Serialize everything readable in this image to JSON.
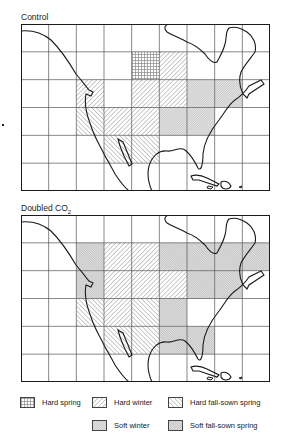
{
  "figure": {
    "maps": [
      {
        "id": "control",
        "title": "Control",
        "title_sub": "",
        "grid": {
          "cols": 9,
          "rows": 6
        },
        "cells": [
          {
            "row": 1,
            "col": 4,
            "type": "hard_spring"
          },
          {
            "row": 1,
            "col": 5,
            "type": "hard_winter"
          },
          {
            "row": 2,
            "col": 2,
            "type": "hard_winter"
          },
          {
            "row": 2,
            "col": 4,
            "type": "hard_winter"
          },
          {
            "row": 2,
            "col": 5,
            "type": "hard_winter"
          },
          {
            "row": 2,
            "col": 6,
            "type": "soft_winter"
          },
          {
            "row": 2,
            "col": 7,
            "type": "soft_winter"
          },
          {
            "row": 3,
            "col": 2,
            "type": "hard_fall_sown_spring"
          },
          {
            "row": 3,
            "col": 3,
            "type": "hard_winter"
          },
          {
            "row": 3,
            "col": 4,
            "type": "hard_winter"
          },
          {
            "row": 3,
            "col": 5,
            "type": "soft_winter"
          },
          {
            "row": 3,
            "col": 6,
            "type": "soft_winter"
          },
          {
            "row": 4,
            "col": 3,
            "type": "hard_fall_sown_spring"
          },
          {
            "row": 4,
            "col": 4,
            "type": "hard_fall_sown_spring"
          }
        ]
      },
      {
        "id": "doubled_co2",
        "title": "Doubled CO",
        "title_sub": "2",
        "grid": {
          "cols": 9,
          "rows": 6
        },
        "cells": [
          {
            "row": 1,
            "col": 2,
            "type": "soft_fall_sown_spring"
          },
          {
            "row": 1,
            "col": 3,
            "type": "hard_winter"
          },
          {
            "row": 1,
            "col": 4,
            "type": "hard_winter"
          },
          {
            "row": 1,
            "col": 5,
            "type": "soft_fall_sown_spring"
          },
          {
            "row": 1,
            "col": 6,
            "type": "soft_fall_sown_spring"
          },
          {
            "row": 1,
            "col": 7,
            "type": "soft_fall_sown_spring"
          },
          {
            "row": 1,
            "col": 8,
            "type": "soft_fall_sown_spring"
          },
          {
            "row": 2,
            "col": 2,
            "type": "soft_fall_sown_spring"
          },
          {
            "row": 2,
            "col": 3,
            "type": "hard_winter"
          },
          {
            "row": 2,
            "col": 4,
            "type": "hard_winter"
          },
          {
            "row": 2,
            "col": 5,
            "type": "hard_winter"
          },
          {
            "row": 2,
            "col": 6,
            "type": "soft_fall_sown_spring"
          },
          {
            "row": 2,
            "col": 7,
            "type": "soft_fall_sown_spring"
          },
          {
            "row": 3,
            "col": 2,
            "type": "hard_fall_sown_spring"
          },
          {
            "row": 3,
            "col": 3,
            "type": "hard_winter"
          },
          {
            "row": 3,
            "col": 4,
            "type": "hard_fall_sown_spring"
          },
          {
            "row": 3,
            "col": 5,
            "type": "soft_fall_sown_spring"
          },
          {
            "row": 4,
            "col": 3,
            "type": "hard_fall_sown_spring"
          },
          {
            "row": 4,
            "col": 4,
            "type": "hard_fall_sown_spring"
          },
          {
            "row": 4,
            "col": 5,
            "type": "soft_fall_sown_spring"
          },
          {
            "row": 4,
            "col": 6,
            "type": "soft_fall_sown_spring"
          }
        ]
      }
    ],
    "legend": [
      {
        "key": "hard_spring",
        "label": "Hard spring",
        "pattern": "grid"
      },
      {
        "key": "hard_winter",
        "label": "Hard winter",
        "pattern": "diagonal-forward"
      },
      {
        "key": "hard_fall_sown_spring",
        "label": "Hard fall-sown spring",
        "pattern": "diagonal-back"
      },
      {
        "key": "soft_winter",
        "label": "Soft winter",
        "pattern": "dense-stipple"
      },
      {
        "key": "soft_fall_sown_spring",
        "label": "Soft fall-sown spring",
        "pattern": "dense-stipple-dark"
      }
    ],
    "colors": {
      "line": "#1a1a1a",
      "grid": "#555555",
      "hatch": "#8a8a8a",
      "background": "#ffffff"
    }
  }
}
